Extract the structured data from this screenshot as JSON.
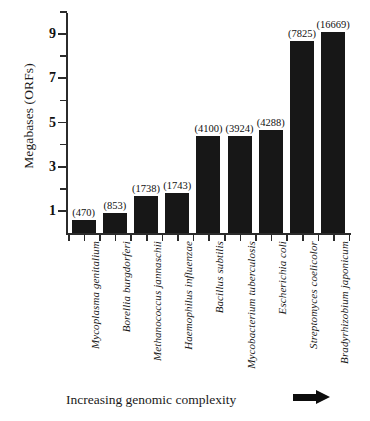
{
  "chart_data": {
    "type": "bar",
    "title": "",
    "xlabel": "Increasing genomic complexity",
    "ylabel": "Megabases (ORFs)",
    "ylim": [
      0,
      10
    ],
    "yticks_major": [
      1,
      3,
      5,
      7,
      9
    ],
    "yticks_minor": [
      2,
      4,
      6,
      8,
      10
    ],
    "grid": false,
    "legend": null,
    "units": "Megabases",
    "categories": [
      "Mycoplasma genitalium",
      "Borellia burgdorferi",
      "Methanococcus jannaschii",
      "Haemophilus influenzae",
      "Bacillus subtilis",
      "Mycobacterium tuberculosis",
      "Escherichia coli",
      "Streptomyces coelicolor",
      "Bradyrhizobium japonicum"
    ],
    "values": [
      0.58,
      0.91,
      1.66,
      1.83,
      4.41,
      4.41,
      4.65,
      8.67,
      9.11
    ],
    "point_labels": [
      "(470)",
      "(853)",
      "(1738)",
      "(1743)",
      "(4100)",
      "(3924)",
      "(4288)",
      "(7825)",
      "(16669)"
    ],
    "orf_counts": [
      470,
      853,
      1738,
      1743,
      4100,
      3924,
      4288,
      7825,
      16669
    ],
    "bar_color": "#171717",
    "axis_color": "#2b2b2b",
    "background": "#ffffff"
  },
  "annotations": {
    "arrow": "right-arrow",
    "arrow_meaning": "increasing direction"
  }
}
